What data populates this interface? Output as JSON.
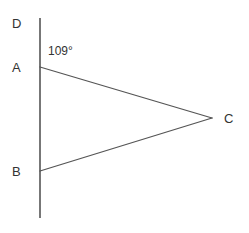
{
  "figure": {
    "type": "geometry-diagram",
    "background_color": "#ffffff",
    "stroke_color": "#555555",
    "label_color": "#333333",
    "width": 249,
    "height": 233,
    "points": {
      "A": {
        "label": "A",
        "x": 40,
        "y": 67
      },
      "B": {
        "label": "B",
        "x": 40,
        "y": 171
      },
      "C": {
        "label": "C",
        "x": 212,
        "y": 118
      },
      "D": {
        "label": "D",
        "x": 40,
        "y": 18
      }
    },
    "segments": [
      {
        "name": "line-DB-extended",
        "from": [
          40,
          18
        ],
        "to": [
          40,
          218
        ]
      },
      {
        "name": "segment-AC",
        "from": [
          40,
          67
        ],
        "to": [
          212,
          118
        ]
      },
      {
        "name": "segment-BC",
        "from": [
          40,
          171
        ],
        "to": [
          212,
          118
        ]
      }
    ],
    "angle": {
      "name": "angle-DAC",
      "value": "109",
      "unit": "°",
      "text": "109°",
      "at_vertex": "A"
    }
  }
}
